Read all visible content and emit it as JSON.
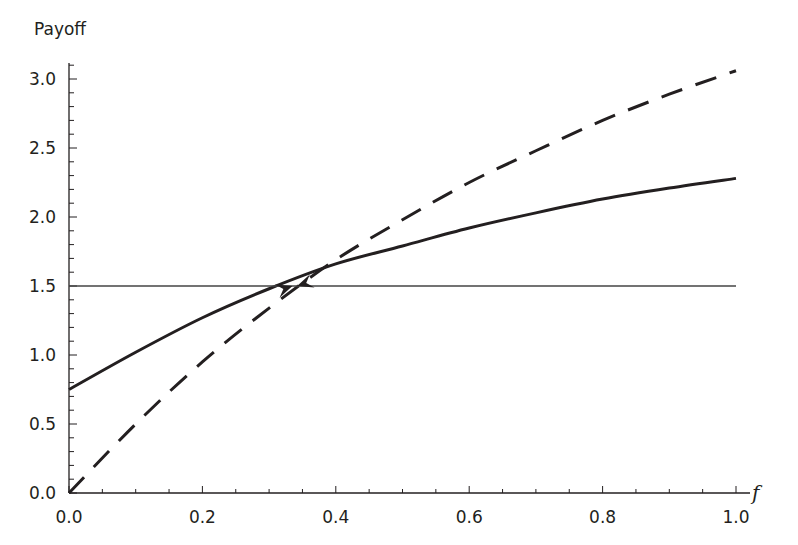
{
  "chart_data": {
    "type": "line",
    "title": "",
    "xlabel": "f",
    "ylabel": "Payoff",
    "xlim": [
      0.0,
      1.0
    ],
    "ylim": [
      0.0,
      3.1
    ],
    "x_ticks": [
      "0.0",
      "0.2",
      "0.4",
      "0.6",
      "0.8",
      "1.0"
    ],
    "x_tick_values": [
      0.0,
      0.2,
      0.4,
      0.6,
      0.8,
      1.0
    ],
    "y_ticks": [
      "0.0",
      "0.5",
      "1.0",
      "1.5",
      "2.0",
      "2.5",
      "3.0"
    ],
    "y_tick_values": [
      0.0,
      0.5,
      1.0,
      1.5,
      2.0,
      2.5,
      3.0
    ],
    "x_minor_step": 0.05,
    "y_minor_step": 0.1,
    "grid": false,
    "legend": null,
    "x": [
      0.0,
      0.1,
      0.2,
      0.3,
      0.4,
      0.5,
      0.6,
      0.7,
      0.8,
      0.9,
      1.0
    ],
    "series": [
      {
        "name": "solid",
        "style": "solid",
        "values": [
          0.75,
          1.02,
          1.27,
          1.48,
          1.66,
          1.79,
          1.92,
          2.03,
          2.13,
          2.21,
          2.28
        ]
      },
      {
        "name": "dashed",
        "style": "dashed",
        "values": [
          0.0,
          0.5,
          0.95,
          1.34,
          1.69,
          1.98,
          2.25,
          2.48,
          2.7,
          2.89,
          3.06
        ]
      },
      {
        "name": "horizontal",
        "style": "thin-solid",
        "values": [
          1.5,
          1.5,
          1.5,
          1.5,
          1.5,
          1.5,
          1.5,
          1.5,
          1.5,
          1.5,
          1.5
        ]
      }
    ],
    "annotations": [
      {
        "type": "arrow",
        "direction": "right",
        "x": 0.335,
        "y": 1.5
      },
      {
        "type": "arrow",
        "direction": "left",
        "x": 0.342,
        "y": 1.5
      }
    ],
    "colors": {
      "ink": "#231f20",
      "background": "#ffffff"
    }
  }
}
